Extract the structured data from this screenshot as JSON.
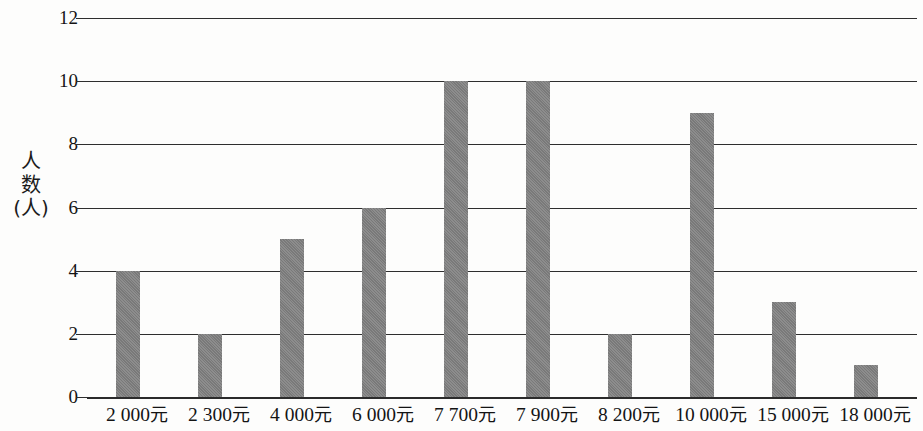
{
  "chart_data": {
    "type": "bar",
    "title": "",
    "subtitle": "",
    "xlabel": "",
    "ylabel": "人数(人)",
    "ylabel_chars": [
      "人",
      "数",
      "(人)"
    ],
    "categories": [
      "2 000元",
      "2 300元",
      "4 000元",
      "6 000元",
      "7 700元",
      "7 900元",
      "8 200元",
      "10 000元",
      "15 000元",
      "18 000元"
    ],
    "values": [
      4,
      2,
      5,
      6,
      10,
      10,
      2,
      9,
      3,
      1
    ],
    "ylim": [
      0,
      12
    ],
    "y_ticks": [
      0,
      2,
      4,
      6,
      8,
      10,
      12
    ],
    "y_tick_labels": [
      "0",
      "2",
      "4",
      "6",
      "8",
      "10",
      "12"
    ],
    "grid": true,
    "grid_axis": "y",
    "legend": false,
    "legend_position": "none",
    "bar_color": "#808080",
    "axis_color": "#2e2e2e",
    "background_color": "#fdfdfc",
    "text_color": "#141414"
  },
  "layout": {
    "plot_left": 87,
    "plot_right": 917,
    "y_zero_px": 397,
    "y_top_px": 18,
    "slot_width": 82,
    "bar_width": 24,
    "first_bar_left": 29
  }
}
